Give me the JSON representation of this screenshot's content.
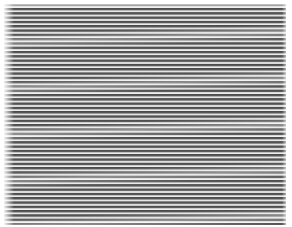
{
  "image": {
    "description": "Striped texture of dark gray horizontal lines on a light background with wavy moire banding",
    "colors": {
      "dark_stripe": "#4a4a4a",
      "light_stripe": "#f0f0f0",
      "border": "#ffffff"
    }
  }
}
